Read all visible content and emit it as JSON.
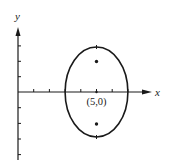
{
  "diagram": {
    "type": "ellipse-plot",
    "axes": {
      "x_label": "x",
      "y_label": "y",
      "origin_px": [
        18,
        92
      ],
      "unit_px": 15.7
    },
    "ellipse": {
      "center": [
        5,
        0
      ],
      "center_label": "(5,0)",
      "semi_axis_x": 2,
      "semi_axis_y": 2.9
    },
    "foci": [
      [
        5,
        2
      ],
      [
        5,
        -2
      ]
    ],
    "x_ticks": [
      1,
      2,
      3,
      4,
      5,
      6,
      7
    ],
    "y_ticks": [
      -4,
      -3,
      -2,
      -1,
      1,
      2,
      3
    ]
  },
  "colors": {
    "stroke": "#1a1a1a",
    "background": "#ffffff"
  }
}
